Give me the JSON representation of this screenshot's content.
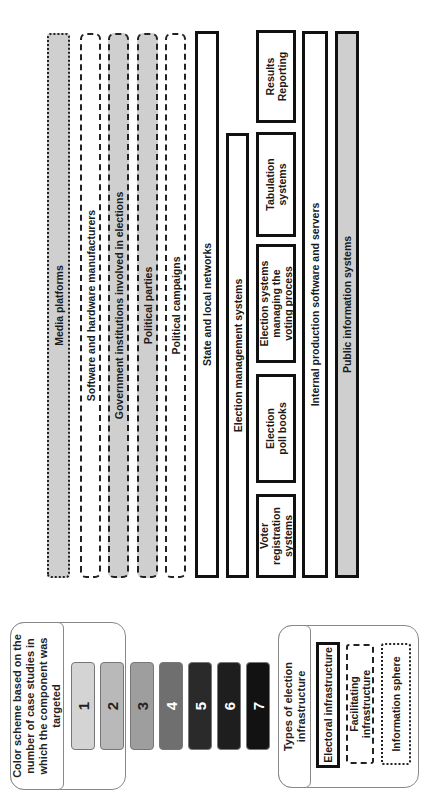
{
  "diagram": {
    "orientation": "rotated -90deg (text reads bottom-to-top)",
    "information_sphere": [
      {
        "label": "Media platforms",
        "style": "dotted",
        "fill": "#cfcfcf"
      }
    ],
    "facilitating_infrastructure": [
      {
        "label": "Software and hardware manufacturers",
        "style": "dashed",
        "fill": "#ffffff"
      },
      {
        "label": "Government institutions involved in elections",
        "style": "dashed",
        "fill": "#cfcfcf"
      },
      {
        "label": "Political parties",
        "style": "dashed",
        "fill": "#cfcfcf"
      },
      {
        "label": "Political campaigns",
        "style": "dashed",
        "fill": "#ffffff"
      }
    ],
    "electoral_infrastructure": {
      "state_local_networks": {
        "label": "State and local networks",
        "fill": "#ffffff"
      },
      "election_management": {
        "label": "Election management systems",
        "fill": "#ffffff"
      },
      "components": [
        {
          "label": "Voter registration systems",
          "fill": "#ffffff"
        },
        {
          "label": "Election poll books",
          "fill": "#ffffff"
        },
        {
          "label": "Election systems managing the voting process",
          "fill": "#ffffff"
        },
        {
          "label": "Tabulation systems",
          "fill": "#ffffff"
        },
        {
          "label": "Results Reporting",
          "fill": "#ffffff"
        }
      ],
      "internal_production": {
        "label": "Internal production software and servers",
        "fill": "#ffffff"
      },
      "public_information": {
        "label": "Public information systems",
        "fill": "#cfcfcf"
      }
    }
  },
  "legend_colors": {
    "title": "Color scheme based on the number of case studies in which the component was targeted",
    "scale": [
      {
        "value": "1",
        "color": "#d4d4d4",
        "text_color": "#222222"
      },
      {
        "value": "2",
        "color": "#b9b9b9",
        "text_color": "#222222"
      },
      {
        "value": "3",
        "color": "#9e9e9e",
        "text_color": "#222222"
      },
      {
        "value": "4",
        "color": "#6f6f6f",
        "text_color": "#ffffff"
      },
      {
        "value": "5",
        "color": "#2a2a2a",
        "text_color": "#ffffff"
      },
      {
        "value": "6",
        "color": "#1e1e1e",
        "text_color": "#ffffff"
      },
      {
        "value": "7",
        "color": "#121212",
        "text_color": "#ffffff"
      }
    ]
  },
  "legend_types": {
    "title": "Types of election infrastructure",
    "items": [
      {
        "label": "Electoral infrastructure",
        "style": "solid"
      },
      {
        "label": "Facilitating infrastructure",
        "style": "dashed"
      },
      {
        "label": "Information sphere",
        "style": "dotted"
      }
    ]
  }
}
